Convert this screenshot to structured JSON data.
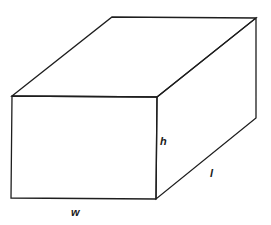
{
  "diagram": {
    "stroke_color": "#1e1e1e",
    "background": "#ffffff",
    "vertices": {
      "front_top_left": [
        12,
        96
      ],
      "front_top_right": [
        157,
        97
      ],
      "front_bottom_left": [
        11,
        198
      ],
      "front_bottom_right": [
        156,
        199
      ],
      "back_top_left": [
        112,
        17
      ],
      "back_top_right": [
        256,
        18
      ],
      "back_bottom_right": [
        256,
        118
      ]
    },
    "labels": {
      "height": "h",
      "length": "l",
      "width": "w"
    }
  }
}
